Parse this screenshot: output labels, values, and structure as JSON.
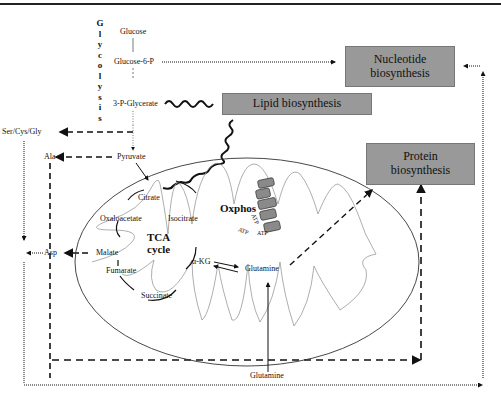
{
  "glycolysis": {
    "label": "Glycolysis",
    "letters": [
      "G",
      "l",
      "y",
      "c",
      "o",
      "l",
      "y",
      "s",
      "i",
      "s"
    ],
    "metabolites": [
      "Glucose",
      "Glucose-6-P",
      "3-P-Glycerate",
      "Pyruvate"
    ]
  },
  "boxes": {
    "nucleotide": {
      "line1": "Nucleotide",
      "line2": "biosynthesis"
    },
    "lipid": {
      "label": "Lipid biosynthesis"
    },
    "protein": {
      "line1": "Protein",
      "line2": "biosynthesis"
    }
  },
  "amino_acids": {
    "ser_cys_gly": "Ser/Cys/Gly",
    "ala": "Ala",
    "asp": "Asp"
  },
  "tca": {
    "title_line1": "TCA",
    "title_line2": "cycle",
    "intermediates": [
      "Citrate",
      "Isocitrate",
      "α-KG",
      "Succinate",
      "Fumarate",
      "Malate",
      "Oxaloacetate"
    ]
  },
  "oxphos": {
    "label": "Oxphos",
    "complexes": [
      "I",
      "II",
      "III",
      "IV",
      "V"
    ],
    "atp_labels": [
      "ATP",
      "ATP",
      "ATP"
    ]
  },
  "glutamine": {
    "inner": "Glutamine",
    "outer": "Glutamine"
  },
  "colors": {
    "box_fill": "#999999",
    "line": "#111111",
    "membrane": "#888888"
  }
}
